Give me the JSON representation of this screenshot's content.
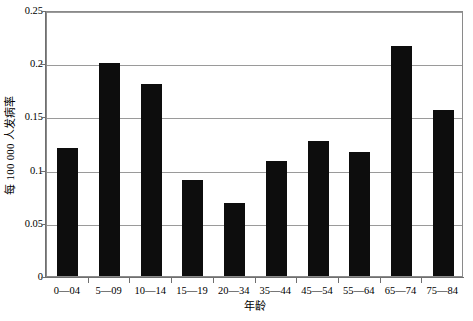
{
  "chart_data": {
    "type": "bar",
    "title": "",
    "xlabel": "年龄",
    "ylabel": "每 100 000 人发病率",
    "categories": [
      "0—04",
      "5—09",
      "10—14",
      "15—19",
      "20—34",
      "35—44",
      "45—54",
      "55—64",
      "65—74",
      "75—84"
    ],
    "values": [
      0.12,
      0.2,
      0.18,
      0.09,
      0.069,
      0.108,
      0.127,
      0.117,
      0.216,
      0.156
    ],
    "ylim": [
      0,
      0.25
    ],
    "yticks": [
      0,
      0.05,
      0.1,
      0.15,
      0.2,
      0.25
    ],
    "ytick_labels": [
      "0",
      "0.05",
      "0.1",
      "0.15",
      "0.2",
      "0.25"
    ],
    "grid": true,
    "grid_axis": "y",
    "legend": "none",
    "bar_color": "#0d0d0d",
    "frame_color": "#8a8a8a",
    "gridline_color": "#9a9a9a",
    "background_color": "#ffffff"
  }
}
